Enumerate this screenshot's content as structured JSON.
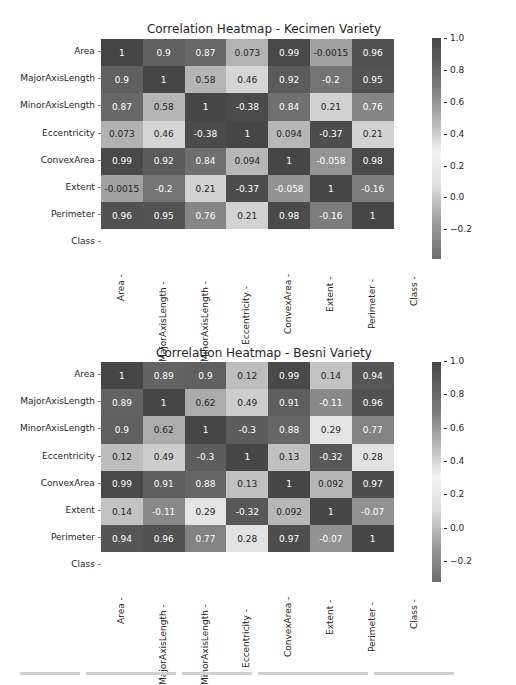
{
  "chart_data": [
    {
      "type": "heatmap",
      "title": "Correlation Heatmap - Kecimen Variety",
      "rows": [
        "Area",
        "MajorAxisLength",
        "MinorAxisLength",
        "Eccentricity",
        "ConvexArea",
        "Extent",
        "Perimeter",
        "Class"
      ],
      "columns": [
        "Area",
        "MajorAxisLength",
        "MinorAxisLength",
        "Eccentricity",
        "ConvexArea",
        "Extent",
        "Perimeter",
        "Class"
      ],
      "values": [
        [
          1,
          0.9,
          0.87,
          0.073,
          0.99,
          -0.0015,
          0.96,
          null
        ],
        [
          0.9,
          1,
          0.58,
          0.46,
          0.92,
          -0.2,
          0.95,
          null
        ],
        [
          0.87,
          0.58,
          1,
          -0.38,
          0.84,
          0.21,
          0.76,
          null
        ],
        [
          0.073,
          0.46,
          -0.38,
          1,
          0.094,
          -0.37,
          0.21,
          null
        ],
        [
          0.99,
          0.92,
          0.84,
          0.094,
          1,
          -0.058,
          0.98,
          null
        ],
        [
          -0.0015,
          -0.2,
          0.21,
          -0.37,
          -0.058,
          1,
          -0.16,
          null
        ],
        [
          0.96,
          0.95,
          0.76,
          0.21,
          0.98,
          -0.16,
          1,
          null
        ],
        [
          null,
          null,
          null,
          null,
          null,
          null,
          null,
          null
        ]
      ],
      "annotations": true,
      "colorbar": {
        "ticks": [
          "1.0",
          "0.8",
          "0.6",
          "0.4",
          "0.2",
          "0.0",
          "−0.2"
        ],
        "range": [
          -0.38,
          1.0
        ]
      },
      "colormap": "diverging-gray (dark at extremes, light near center)"
    },
    {
      "type": "heatmap",
      "title": "Correlation Heatmap - Besni Variety",
      "rows": [
        "Area",
        "MajorAxisLength",
        "MinorAxisLength",
        "Eccentricity",
        "ConvexArea",
        "Extent",
        "Perimeter",
        "Class"
      ],
      "columns": [
        "Area",
        "MajorAxisLength",
        "MinorAxisLength",
        "Eccentricity",
        "ConvexArea",
        "Extent",
        "Perimeter",
        "Class"
      ],
      "values": [
        [
          1,
          0.89,
          0.9,
          0.12,
          0.99,
          0.14,
          0.94,
          null
        ],
        [
          0.89,
          1,
          0.62,
          0.49,
          0.91,
          -0.11,
          0.96,
          null
        ],
        [
          0.9,
          0.62,
          1,
          -0.3,
          0.88,
          0.29,
          0.77,
          null
        ],
        [
          0.12,
          0.49,
          -0.3,
          1,
          0.13,
          -0.32,
          0.28,
          null
        ],
        [
          0.99,
          0.91,
          0.88,
          0.13,
          1,
          0.092,
          0.97,
          null
        ],
        [
          0.14,
          -0.11,
          0.29,
          -0.32,
          0.092,
          1,
          -0.07,
          null
        ],
        [
          0.94,
          0.96,
          0.77,
          0.28,
          0.97,
          -0.07,
          1,
          null
        ],
        [
          null,
          null,
          null,
          null,
          null,
          null,
          null,
          null
        ]
      ],
      "annotations": true,
      "colorbar": {
        "ticks": [
          "1.0",
          "0.8",
          "0.6",
          "0.4",
          "0.2",
          "0.0",
          "−0.2"
        ],
        "range": [
          -0.32,
          1.0
        ]
      },
      "colormap": "diverging-gray (dark at extremes, light near center)"
    }
  ]
}
